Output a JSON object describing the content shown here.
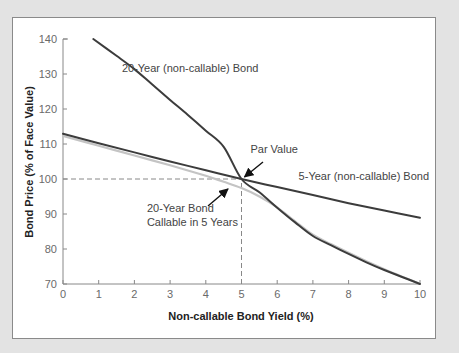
{
  "chart_data": {
    "type": "line",
    "title": "",
    "xlabel": "Non-callable Bond Yield (%)",
    "ylabel": "Bond Price (% of Face Value)",
    "xlim": [
      0,
      10
    ],
    "ylim": [
      70,
      140
    ],
    "xticks": [
      0,
      1,
      2,
      3,
      4,
      5,
      6,
      7,
      8,
      9,
      10
    ],
    "yticks": [
      70,
      80,
      90,
      100,
      110,
      120,
      130,
      140
    ],
    "grid": false,
    "series": [
      {
        "name": "20-Year (non-callable) Bond",
        "color": "#3c3c3c",
        "x": [
          0.85,
          1.5,
          2,
          2.5,
          3,
          3.5,
          4,
          4.5,
          5,
          5.5,
          6,
          6.5,
          7,
          7.5,
          8,
          8.5,
          9,
          9.5,
          10
        ],
        "y": [
          140,
          135.2,
          131.4,
          127,
          122.6,
          118.3,
          113.8,
          109.2,
          100,
          96.2,
          91.8,
          87.6,
          83.7,
          81.1,
          78.6,
          76.2,
          74,
          72,
          70
        ]
      },
      {
        "name": "5-Year (non-callable) Bond",
        "color": "#3c3c3c",
        "x": [
          0,
          1,
          2,
          3,
          4,
          5,
          6,
          7,
          8,
          9,
          10
        ],
        "y": [
          112.9,
          110.2,
          107.6,
          105,
          102.5,
          100,
          97.7,
          95.4,
          93.1,
          91,
          88.9
        ]
      },
      {
        "name": "20-Year Bond Callable in 5 Years",
        "color": "#c4c4c4",
        "x": [
          0,
          1,
          2,
          3,
          4,
          4.5,
          5,
          5.5,
          6,
          6.5,
          7,
          7.5,
          8,
          8.5,
          9,
          9.5,
          10
        ],
        "y": [
          112.3,
          109.5,
          106.7,
          103.9,
          100.9,
          99.2,
          97.4,
          95,
          91.9,
          87.9,
          84.1,
          81.4,
          78.9,
          76.5,
          74.2,
          72.1,
          70.1
        ]
      }
    ],
    "reference_lines": [
      {
        "type": "horizontal",
        "y": 100,
        "x_from": 0,
        "x_to": 5,
        "style": "dashed"
      },
      {
        "type": "vertical",
        "x": 5,
        "y_from": 70,
        "y_to": 100,
        "style": "dashed"
      }
    ],
    "annotations": [
      {
        "text": "20-Year (non-callable) Bond",
        "x": 1.65,
        "y": 130.5
      },
      {
        "text": "Par Value",
        "x": 5.25,
        "y": 107.5,
        "arrow_to": [
          5,
          100
        ]
      },
      {
        "text": "5-Year (non-callable) Bond",
        "x": 6.6,
        "y": 99.6
      },
      {
        "text": "20-Year Bond",
        "x": 2.35,
        "y": 90.6
      },
      {
        "text": "Callable in 5 Years",
        "x": 2.35,
        "y": 86.6,
        "arrow_to": [
          4.85,
          97.6
        ]
      }
    ]
  },
  "labels": {
    "xlabel": "Non-callable Bond Yield (%)",
    "ylabel": "Bond Price (% of Face Value)",
    "annot_20yr": "20-Year (non-callable) Bond",
    "annot_par": "Par Value",
    "annot_5yr": "5-Year (non-callable) Bond",
    "annot_callable_1": "20-Year Bond",
    "annot_callable_2": "Callable in 5 Years"
  }
}
